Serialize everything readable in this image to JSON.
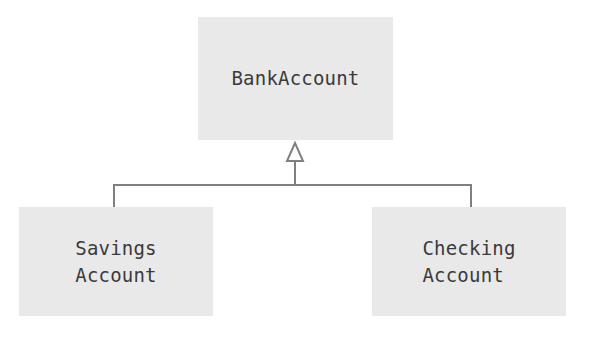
{
  "diagram": {
    "type": "uml-class-diagram",
    "background_color": "#ffffff",
    "box_fill_color": "#e9e9e9",
    "text_color": "#3a3a3a",
    "connector_color": "#808080",
    "relationship": "generalization",
    "classes": [
      {
        "id": "bankaccount",
        "name": "BankAccount",
        "role": "superclass",
        "x": 198,
        "y": 17,
        "width": 195,
        "height": 123
      },
      {
        "id": "savingsaccount",
        "name": "Savings\nAccount",
        "role": "subclass",
        "x": 19,
        "y": 207,
        "width": 194,
        "height": 109
      },
      {
        "id": "checkingaccount",
        "name": "Checking\nAccount",
        "role": "subclass",
        "x": 372,
        "y": 207,
        "width": 194,
        "height": 109
      }
    ],
    "connectors": {
      "arrowhead": "hollow-triangle",
      "arrowhead_x": 295,
      "arrowhead_top_y": 143,
      "arrowhead_bottom_y": 160,
      "stem_x": 295,
      "stem_top_y": 160,
      "stem_bottom_y": 185,
      "crossbar_y": 185,
      "crossbar_left_x": 114,
      "crossbar_right_x": 471,
      "left_drop_x": 114,
      "right_drop_x": 471,
      "drop_top_y": 185,
      "drop_bottom_y": 207,
      "stroke_width": 2
    }
  }
}
